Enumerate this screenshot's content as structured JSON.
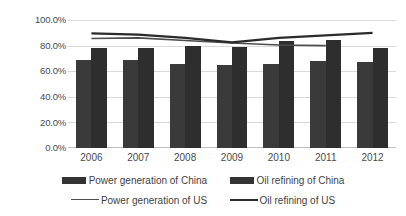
{
  "chart_data": {
    "type": "bar",
    "title": "",
    "subtitle": "",
    "xlabel": "",
    "ylabel": "",
    "categories": [
      "2006",
      "2007",
      "2008",
      "2009",
      "2010",
      "2011",
      "2012"
    ],
    "ylim": [
      0,
      1.0
    ],
    "ytick_labels": [
      "0.0%",
      "20.0%",
      "40.0%",
      "60.0%",
      "80.0%",
      "100.0%"
    ],
    "ytick_values": [
      0,
      20,
      40,
      60,
      80,
      100
    ],
    "grid": true,
    "legend_position": "bottom",
    "series": [
      {
        "name": "Power generation of China",
        "kind": "bar",
        "color": "#3a3a3a",
        "values": [
          69.0,
          69.0,
          66.0,
          64.5,
          66.0,
          68.0,
          67.0
        ]
      },
      {
        "name": "Oil refining of China",
        "kind": "bar",
        "color": "#2e2e2e",
        "values": [
          78.0,
          78.0,
          79.5,
          79.0,
          83.5,
          84.5,
          78.5
        ]
      },
      {
        "name": "Power generation of US",
        "kind": "line",
        "color": "#4d4d4d",
        "values": [
          85.5,
          86.0,
          84.0,
          82.0,
          80.5,
          80.0,
          null
        ]
      },
      {
        "name": "Oil refining of US",
        "kind": "line",
        "color": "#2b2b2b",
        "values": [
          89.5,
          88.5,
          86.0,
          82.5,
          86.0,
          88.0,
          90.0
        ]
      }
    ]
  },
  "axis": {
    "ytick_0": "0.0%",
    "ytick_1": "20.0%",
    "ytick_2": "40.0%",
    "ytick_3": "60.0%",
    "ytick_4": "80.0%",
    "ytick_5": "100.0%",
    "xtick_0": "2006",
    "xtick_1": "2007",
    "xtick_2": "2008",
    "xtick_3": "2009",
    "xtick_4": "2010",
    "xtick_5": "2011",
    "xtick_6": "2012"
  },
  "legend": {
    "items": [
      {
        "label": "Power generation of China",
        "marker": "bar-swatch-icon",
        "color": "#333333"
      },
      {
        "label": "Oil refining of China",
        "marker": "bar-swatch-icon",
        "color": "#2b2b2b"
      },
      {
        "label": "Power generation of US",
        "marker": "line-swatch-icon",
        "color": "#4d4d4d"
      },
      {
        "label": "Oil refining of US",
        "marker": "line-swatch-icon",
        "color": "#2b2b2b"
      }
    ]
  },
  "colors": {
    "background": "#ffffff",
    "gridline": "#d9d9d9",
    "axis": "#bfbfbf",
    "text": "#3f3f3f",
    "bar_power_china": "#3a3a3a",
    "bar_oil_china": "#2e2e2e",
    "line_power_us": "#4d4d4d",
    "line_oil_us": "#2b2b2b"
  }
}
